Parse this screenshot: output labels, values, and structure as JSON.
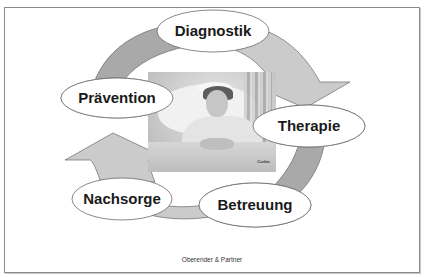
{
  "diagram": {
    "title": "",
    "nodes": [
      {
        "id": "diagnostik",
        "label": "Diagnostik"
      },
      {
        "id": "therapie",
        "label": "Therapie"
      },
      {
        "id": "betreuung",
        "label": "Betreuung"
      },
      {
        "id": "nachsorge",
        "label": "Nachsorge"
      },
      {
        "id": "praevention",
        "label": "Prävention"
      }
    ],
    "edges": [
      {
        "from": "diagnostik",
        "to": "therapie"
      },
      {
        "from": "therapie",
        "to": "betreuung"
      },
      {
        "from": "betreuung",
        "to": "nachsorge"
      },
      {
        "from": "nachsorge",
        "to": "praevention"
      },
      {
        "from": "praevention",
        "to": "diagnostik"
      }
    ],
    "center_image": {
      "description": "patient resting in hospital bed",
      "credit": "Corbis"
    }
  },
  "footer": {
    "text": "Oberender & Partner"
  },
  "colors": {
    "arc_dark": "#a9a9a9",
    "arc_light": "#cbcbcb",
    "ellipse_fill": "#ffffff",
    "outline": "#6a6a6a"
  }
}
